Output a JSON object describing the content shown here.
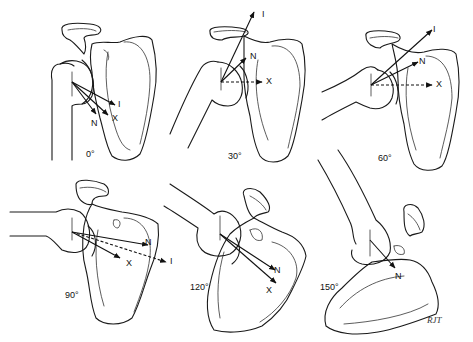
{
  "figure": {
    "panels": [
      {
        "id": "p0",
        "angle_label": "0°",
        "vectors": [
          "I",
          "X",
          "N"
        ]
      },
      {
        "id": "p30",
        "angle_label": "30°",
        "vectors": [
          "I",
          "N",
          "X"
        ]
      },
      {
        "id": "p60",
        "angle_label": "60°",
        "vectors": [
          "I",
          "N",
          "X"
        ]
      },
      {
        "id": "p90",
        "angle_label": "90°",
        "vectors": [
          "N",
          "X",
          "I"
        ]
      },
      {
        "id": "p120",
        "angle_label": "120°",
        "vectors": [
          "N",
          "X"
        ]
      },
      {
        "id": "p150",
        "angle_label": "150°",
        "vectors": [
          "N"
        ]
      }
    ],
    "vector_labels": {
      "I": "I",
      "X": "X",
      "N": "N"
    },
    "signature": "RJT",
    "colors": {
      "line": "#1a1a1a",
      "background": "#ffffff"
    }
  }
}
